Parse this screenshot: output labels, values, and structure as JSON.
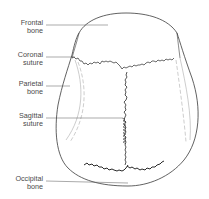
{
  "diagram": {
    "colors": {
      "line": "#3a3a3a",
      "faint_line": "#9a9a9a",
      "text": "#4a4a4a",
      "background": "#ffffff"
    },
    "labels": [
      {
        "id": "frontal-bone",
        "line1": "Frontal",
        "line2": "bone"
      },
      {
        "id": "coronal-suture",
        "line1": "Coronal",
        "line2": "suture"
      },
      {
        "id": "parietal-bone",
        "line1": "Parietal",
        "line2": "bone"
      },
      {
        "id": "sagittal-suture",
        "line1": "Sagittal",
        "line2": "suture"
      },
      {
        "id": "occipital-bone",
        "line1": "Occipital",
        "line2": "bone"
      }
    ]
  }
}
